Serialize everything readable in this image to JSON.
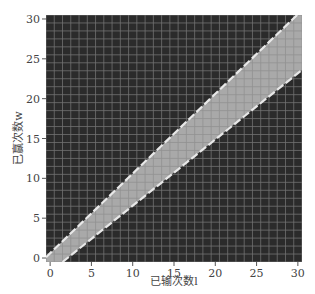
{
  "chart_data": {
    "type": "heatmap",
    "title": "",
    "xlabel": "已输次数l",
    "ylabel": "已赢次数w",
    "xlim": [
      -0.5,
      30.5
    ],
    "ylim": [
      -0.5,
      30.5
    ],
    "xticks": [
      0,
      5,
      10,
      15,
      20,
      25,
      30
    ],
    "yticks": [
      0,
      5,
      10,
      15,
      20,
      25,
      30
    ],
    "grid": true,
    "grid_size": 31,
    "background_color": "#2b2b2b",
    "band_color": "#a9a9a9",
    "gridline_color": "#8a8a8a",
    "boundary_line_color": "#e8e8e8",
    "boundary_line_style": "dashed",
    "band": {
      "description": "light region between two dashed boundary lines",
      "upper_boundary": {
        "x": [
          -0.5,
          30.5
        ],
        "y": [
          0.1,
          31.1
        ],
        "equation": "w = l + 0.6"
      },
      "lower_boundary": {
        "x": [
          1.5,
          30.5
        ],
        "y": [
          -0.5,
          23.6
        ],
        "equation": "w ≈ 0.82(l - 1.5)"
      }
    }
  },
  "axes": {
    "x_label": "已输次数l",
    "y_label": "已赢次数w",
    "x_ticks": [
      "0",
      "5",
      "10",
      "15",
      "20",
      "25",
      "30"
    ],
    "y_ticks": [
      "0",
      "5",
      "10",
      "15",
      "20",
      "25",
      "30"
    ]
  }
}
